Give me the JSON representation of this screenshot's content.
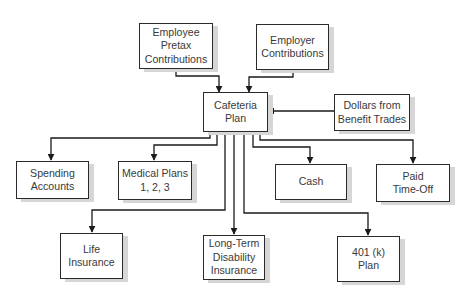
{
  "diagram": {
    "type": "flowchart",
    "colors": {
      "border": "#2a2a2a",
      "text": "#3a3a3a",
      "shadow": "#d6d6d6",
      "background": "#ffffff"
    },
    "nodes": {
      "employee_pretax": {
        "label": "Employee\nPretax\nContributions"
      },
      "employer": {
        "label": "Employer\nContributions"
      },
      "cafeteria": {
        "label": "Cafeteria\nPlan"
      },
      "dollars_trades": {
        "label": "Dollars from\nBenefit Trades"
      },
      "spending": {
        "label": "Spending\nAccounts"
      },
      "medical": {
        "label": "Medical Plans\n1, 2, 3"
      },
      "cash": {
        "label": "Cash"
      },
      "paid_time_off": {
        "label": "Paid\nTime-Off"
      },
      "life": {
        "label": "Life\nInsurance"
      },
      "ltd": {
        "label": "Long-Term\nDisability\nInsurance"
      },
      "k401": {
        "label": "401 (k)\nPlan"
      }
    },
    "edges": [
      {
        "from": "employee_pretax",
        "to": "cafeteria"
      },
      {
        "from": "employer",
        "to": "cafeteria"
      },
      {
        "from": "dollars_trades",
        "to": "cafeteria"
      },
      {
        "from": "cafeteria",
        "to": "spending"
      },
      {
        "from": "cafeteria",
        "to": "medical"
      },
      {
        "from": "cafeteria",
        "to": "life"
      },
      {
        "from": "cafeteria",
        "to": "ltd"
      },
      {
        "from": "cafeteria",
        "to": "k401"
      },
      {
        "from": "cafeteria",
        "to": "cash"
      },
      {
        "from": "cafeteria",
        "to": "paid_time_off"
      }
    ]
  }
}
